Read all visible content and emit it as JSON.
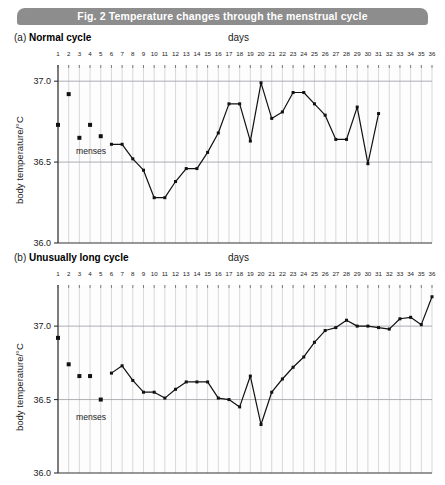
{
  "figure": {
    "banner_title": "Fig. 2  Temperature changes through the menstrual cycle",
    "banner_color": "#8d8d8d",
    "banner_text_color": "#ffffff"
  },
  "panel_a": {
    "letter": "(a)",
    "title": "Normal cycle",
    "days_axis_label": "days",
    "y_axis_label": "body temperature/°C",
    "menses_label": "menses",
    "y_ticks": [
      "37.0",
      "36.5",
      "36.0"
    ]
  },
  "panel_b": {
    "letter": "(b)",
    "title": "Unusually long cycle",
    "days_axis_label": "days",
    "y_axis_label": "body temperature/°C",
    "menses_label": "menses",
    "y_ticks": [
      "37.0",
      "36.5",
      "36.0"
    ]
  },
  "chart_data": [
    {
      "type": "line",
      "id": "normal-cycle",
      "title": "(a) Normal cycle",
      "xlabel": "days",
      "ylabel": "body temperature/°C",
      "xlim": [
        1,
        36
      ],
      "ylim": [
        36.0,
        37.1
      ],
      "ytick_values": [
        36.0,
        36.5,
        37.0
      ],
      "xtick_values": [
        1,
        2,
        3,
        4,
        5,
        6,
        7,
        8,
        9,
        10,
        11,
        12,
        13,
        14,
        15,
        16,
        17,
        18,
        19,
        20,
        21,
        22,
        23,
        24,
        25,
        26,
        27,
        28,
        29,
        30,
        31,
        32,
        33,
        34,
        35,
        36
      ],
      "grid": "vertical lines each day, horizontal lines at 36.5 and 37.0",
      "legend": "none",
      "annotations": [
        {
          "text": "menses",
          "day": 4,
          "value": 36.57
        }
      ],
      "series": [
        {
          "name": "menses (unconnected points)",
          "connected": false,
          "marker": "square",
          "x": [
            1,
            2,
            3,
            4,
            5
          ],
          "values": [
            36.73,
            36.92,
            36.65,
            36.73,
            36.66
          ]
        },
        {
          "name": "basal body temperature",
          "connected": true,
          "marker": "square",
          "x": [
            6,
            7,
            8,
            9,
            10,
            11,
            12,
            13,
            14,
            15,
            16,
            17,
            18,
            19,
            20,
            21,
            22,
            23,
            24,
            25,
            26,
            27,
            28,
            29,
            30,
            31
          ],
          "values": [
            36.61,
            36.61,
            36.52,
            36.45,
            36.28,
            36.28,
            36.38,
            36.46,
            36.46,
            36.56,
            36.68,
            36.86,
            36.86,
            36.63,
            36.99,
            36.77,
            36.81,
            36.93,
            36.93,
            36.86,
            36.79,
            36.64,
            36.64,
            36.84,
            36.49,
            36.8
          ]
        }
      ]
    },
    {
      "type": "line",
      "id": "unusually-long-cycle",
      "title": "(b) Unusually long cycle",
      "xlabel": "days",
      "ylabel": "body temperature/°C",
      "xlim": [
        1,
        36
      ],
      "ylim": [
        36.0,
        37.3
      ],
      "ytick_values": [
        36.0,
        36.5,
        37.0
      ],
      "xtick_values": [
        1,
        2,
        3,
        4,
        5,
        6,
        7,
        8,
        9,
        10,
        11,
        12,
        13,
        14,
        15,
        16,
        17,
        18,
        19,
        20,
        21,
        22,
        23,
        24,
        25,
        26,
        27,
        28,
        29,
        30,
        31,
        32,
        33,
        34,
        35,
        36
      ],
      "grid": "vertical lines each day, horizontal lines at 36.5 and 37.0",
      "legend": "none",
      "annotations": [
        {
          "text": "menses",
          "day": 4,
          "value": 36.38
        }
      ],
      "series": [
        {
          "name": "menses (unconnected points)",
          "connected": false,
          "marker": "square",
          "x": [
            1,
            2,
            3,
            4,
            5
          ],
          "values": [
            36.92,
            36.74,
            36.66,
            36.66,
            36.5
          ]
        },
        {
          "name": "basal body temperature",
          "connected": true,
          "marker": "square",
          "x": [
            6,
            7,
            8,
            9,
            10,
            11,
            12,
            13,
            14,
            15,
            16,
            17,
            18,
            19,
            20,
            21,
            22,
            23,
            24,
            25,
            26,
            27,
            28,
            29,
            30,
            31,
            32,
            33,
            34,
            35,
            36
          ],
          "values": [
            36.68,
            36.73,
            36.63,
            36.55,
            36.55,
            36.51,
            36.57,
            36.62,
            36.62,
            36.62,
            36.51,
            36.5,
            36.45,
            36.66,
            36.33,
            36.55,
            36.64,
            36.72,
            36.79,
            36.89,
            36.97,
            36.99,
            37.04,
            37.0,
            37.0,
            36.99,
            36.98,
            37.05,
            37.06,
            37.01,
            37.2
          ]
        }
      ]
    }
  ]
}
